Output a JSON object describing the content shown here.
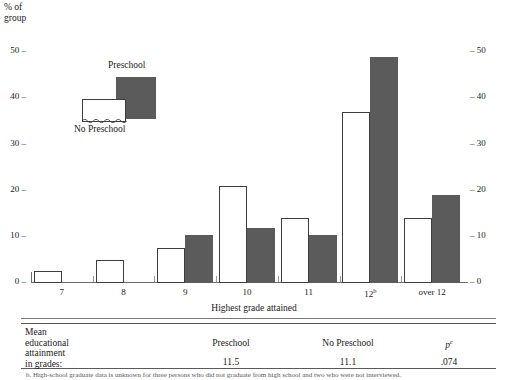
{
  "figure": {
    "y_axis_title": "% of group",
    "x_axis_title": "Highest grade attained"
  },
  "legend": {
    "preschool_label": "Preschool",
    "no_preschool_label": "No Preschool",
    "preschool_color": "#5b5b5b",
    "no_preschool_color": "#ffffff"
  },
  "chart_data": {
    "type": "bar",
    "title": "",
    "xlabel": "Highest grade attained",
    "ylabel": "% of group",
    "categories": [
      "7",
      "8",
      "9",
      "10",
      "11",
      "12ᵇ",
      "over 12"
    ],
    "category_labels_html": [
      "7",
      "8",
      "9",
      "10",
      "11",
      "12<sup>b</sup>",
      "over 12"
    ],
    "series": [
      {
        "name": "No Preschool",
        "color": "#ffffff",
        "values": [
          2.5,
          5,
          7.5,
          21,
          14,
          37,
          14
        ]
      },
      {
        "name": "Preschool",
        "color": "#5b5b5b",
        "values": [
          0,
          0,
          10.5,
          12,
          10.5,
          49,
          19
        ]
      }
    ],
    "ylim": [
      0,
      52
    ],
    "yticks": [
      0,
      10,
      20,
      30,
      40,
      50
    ],
    "ytick_labels_left": [
      "0 –",
      "10 –",
      "20 –",
      "30 –",
      "40 –",
      "50 –"
    ],
    "ytick_labels_right": [
      "– 0",
      "– 10",
      "– 20",
      "– 30",
      "– 40",
      "– 50"
    ],
    "grid": false,
    "legend_position": "upper-left-inset",
    "dual_y_axis": true
  },
  "table": {
    "row_label": "Mean educational attainment in grades:",
    "row_label_lines": [
      "Mean",
      "educational",
      "attainment",
      "in grades:"
    ],
    "columns": [
      {
        "header": "Preschool",
        "value": "11.5"
      },
      {
        "header": "No Preschool",
        "value": "11.1"
      },
      {
        "header": "p",
        "header_sup": "c",
        "value": ".074"
      }
    ]
  },
  "footnote": {
    "text": "b. High-school graduate data is unknown for three persons who did not graduate from high school and two who were not interviewed."
  }
}
